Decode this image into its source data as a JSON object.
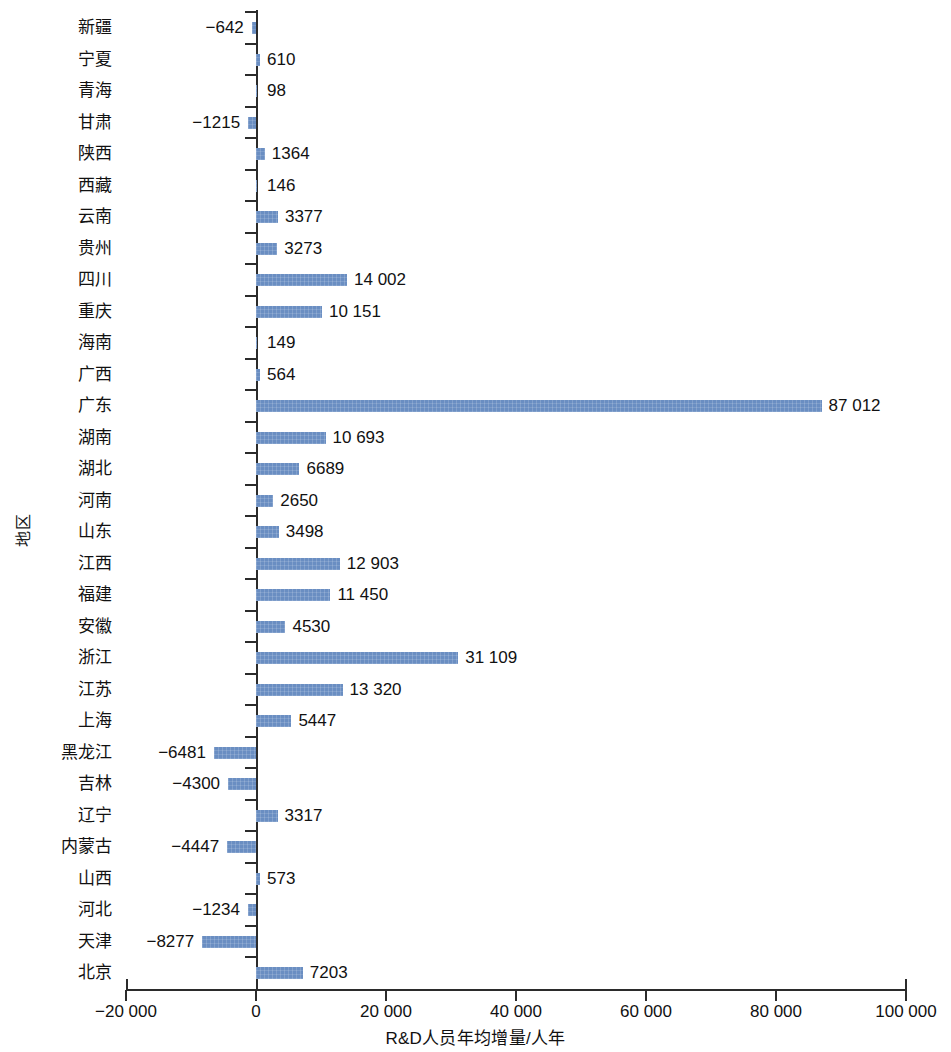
{
  "chart_data": {
    "type": "bar",
    "orientation": "horizontal",
    "title": "",
    "xlabel": "R&D人员年均增量/人年",
    "ylabel": "地区",
    "xlim": [
      -20000,
      100000
    ],
    "xticks": [
      -20000,
      0,
      20000,
      40000,
      60000,
      80000,
      100000
    ],
    "xtick_labels": [
      "−20 000",
      "0",
      "20 000",
      "40 000",
      "60 000",
      "80 000",
      "100 000"
    ],
    "grid": false,
    "legend": null,
    "bar_color": "#6a8ec2",
    "axis_color": "#2b2b2b",
    "categories": [
      "新疆",
      "宁夏",
      "青海",
      "甘肃",
      "陕西",
      "西藏",
      "云南",
      "贵州",
      "四川",
      "重庆",
      "海南",
      "广西",
      "广东",
      "湖南",
      "湖北",
      "河南",
      "山东",
      "江西",
      "福建",
      "安徽",
      "浙江",
      "江苏",
      "上海",
      "黑龙江",
      "吉林",
      "辽宁",
      "内蒙古",
      "山西",
      "河北",
      "天津",
      "北京"
    ],
    "values": [
      -642,
      610,
      98,
      -1215,
      1364,
      146,
      3377,
      3273,
      14002,
      10151,
      149,
      564,
      87012,
      10693,
      6689,
      2650,
      3498,
      12903,
      11450,
      4530,
      31109,
      13320,
      5447,
      -6481,
      -4300,
      3317,
      -4447,
      573,
      -1234,
      -8277,
      7203
    ],
    "value_labels": [
      "−642",
      "610",
      "98",
      "−1215",
      "1364",
      "146",
      "3377",
      "3273",
      "14 002",
      "10 151",
      "149",
      "564",
      "87 012",
      "10 693",
      "6689",
      "2650",
      "3498",
      "12 903",
      "11 450",
      "4530",
      "31 109",
      "13 320",
      "5447",
      "−6481",
      "−4300",
      "3317",
      "−4447",
      "573",
      "−1234",
      "−8277",
      "7203"
    ]
  }
}
